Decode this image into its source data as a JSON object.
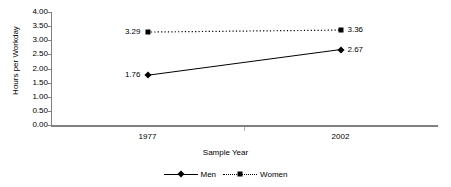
{
  "chart_data": {
    "type": "line",
    "title": "",
    "xlabel": "Sample Year",
    "ylabel": "Hours per Workday",
    "categories": [
      "1977",
      "2002"
    ],
    "ylim": [
      0.0,
      4.0
    ],
    "ytick_labels": [
      "4.00",
      "3.50",
      "3.00",
      "2.50",
      "2.00",
      "1.50",
      "1.00",
      "0.50",
      "0.00"
    ],
    "ytick_values": [
      4.0,
      3.5,
      3.0,
      2.5,
      2.0,
      1.5,
      1.0,
      0.5,
      0.0
    ],
    "grid": false,
    "legend_position": "bottom-center",
    "series": [
      {
        "name": "Men",
        "values": [
          1.76,
          2.67
        ],
        "data_labels": [
          "1.76",
          "2.67"
        ],
        "line_style": "solid",
        "marker": "diamond",
        "color": "#000000"
      },
      {
        "name": "Women",
        "values": [
          3.29,
          3.36
        ],
        "data_labels": [
          "3.29",
          "3.36"
        ],
        "line_style": "dotted",
        "marker": "square",
        "color": "#000000"
      }
    ]
  },
  "axis": {
    "line_color": "#808080",
    "tick_color": "#808080"
  },
  "legend": {
    "entries": [
      {
        "label": "Men",
        "marker": "diamond-marker",
        "line_style": "solid"
      },
      {
        "label": "Women",
        "marker": "square-marker",
        "line_style": "dotted"
      }
    ]
  }
}
